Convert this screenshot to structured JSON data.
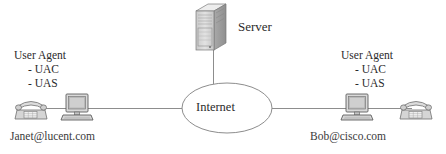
{
  "diagram": {
    "type": "network-topology",
    "colors": {
      "line": "#8d8d8d",
      "text": "#2b2b2b",
      "device_fill": "#d8d8d8",
      "device_stroke": "#6e6e6e",
      "cloud_stroke": "#8d8d8d"
    },
    "nodes": {
      "server": {
        "label": "Server",
        "icon": "server-tower-icon"
      },
      "internet": {
        "label": "Internet",
        "shape": "ellipse"
      },
      "left_endpoint": {
        "title": "User Agent",
        "roles": [
          "- UAC",
          "- UAS"
        ],
        "address": "Janet@lucent.com",
        "devices": [
          "telephone-icon",
          "desktop-computer-icon"
        ]
      },
      "right_endpoint": {
        "title": "User Agent",
        "roles": [
          "- UAC",
          "- UAS"
        ],
        "address": "Bob@cisco.com",
        "devices": [
          "desktop-computer-icon",
          "telephone-icon"
        ]
      }
    },
    "links": [
      {
        "from": "server",
        "to": "internet",
        "orientation": "vertical"
      },
      {
        "from": "left_endpoint",
        "to": "internet",
        "orientation": "horizontal"
      },
      {
        "from": "internet",
        "to": "right_endpoint",
        "orientation": "horizontal"
      }
    ]
  }
}
